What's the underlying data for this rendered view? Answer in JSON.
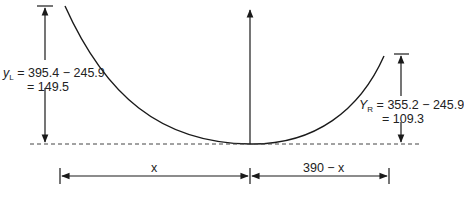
{
  "diagram": {
    "type": "cable sag geometry",
    "left_sag": {
      "symbol": "y",
      "subscript": "L",
      "expression": "= 395.4 − 245.9",
      "result": "= 149.5"
    },
    "right_sag": {
      "symbol": "Y",
      "subscript": "R",
      "expression": "= 355.2 − 245.9",
      "result": "= 109.3"
    },
    "left_span_label": "x",
    "right_span_label": "390 − x",
    "span_total": 390,
    "colors": {
      "line": "#1a1a1a",
      "dashed": "#444444",
      "background": "#ffffff"
    }
  }
}
